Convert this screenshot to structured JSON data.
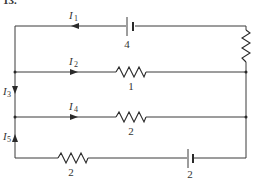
{
  "question_number": "13.",
  "colors": {
    "wire": "#3a3a3a",
    "text": "#333333",
    "background": "#ffffff"
  },
  "currents": {
    "i1": {
      "symbol": "I",
      "sub": "1",
      "direction": "left"
    },
    "i2": {
      "symbol": "I",
      "sub": "2",
      "direction": "right"
    },
    "i3": {
      "symbol": "I",
      "sub": "3",
      "direction": "down"
    },
    "i4": {
      "symbol": "I",
      "sub": "4",
      "direction": "right"
    },
    "i5": {
      "symbol": "I",
      "sub": "5",
      "direction": "up"
    }
  },
  "components": {
    "top_battery": {
      "type": "battery",
      "value": "4"
    },
    "right_resistor": {
      "type": "resistor",
      "value": ""
    },
    "branch2_resistor": {
      "type": "resistor",
      "value": "1"
    },
    "branch4_resistor": {
      "type": "resistor",
      "value": "2"
    },
    "bottom_resistor": {
      "type": "resistor",
      "value": "2"
    },
    "bottom_battery": {
      "type": "battery",
      "value": "2"
    }
  }
}
